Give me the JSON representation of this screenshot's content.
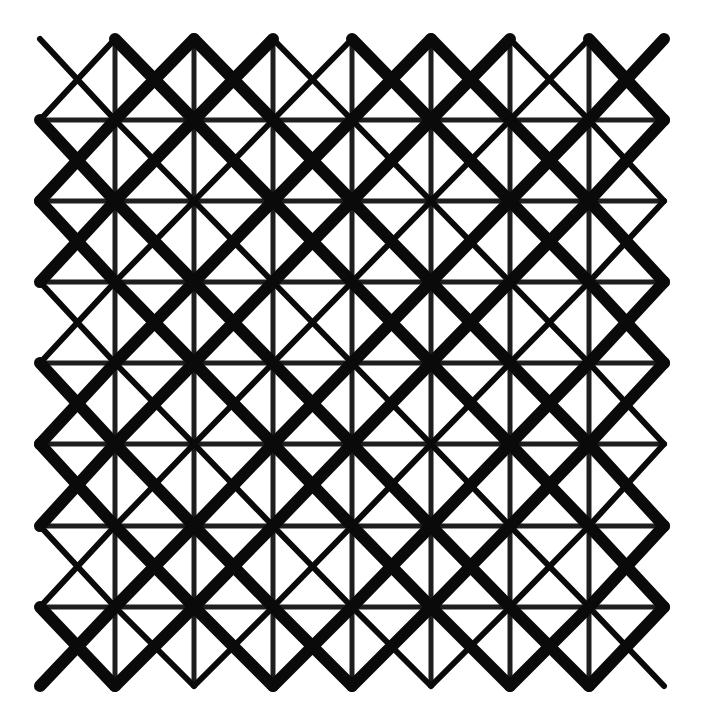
{
  "artwork": {
    "title": "Geometric lattice pattern",
    "background_color": "#ffffff",
    "ink_color": "#0a0a0a",
    "grid_color": "#1e1e1e",
    "bounds": {
      "left": 40,
      "top": 39,
      "right": 664,
      "bottom": 686
    },
    "verticals_x": [
      115,
      194,
      273,
      352,
      431,
      510,
      589
    ],
    "horizontals_y": [
      120,
      201,
      282,
      363,
      444,
      526,
      607
    ],
    "grid_stroke_width": 5,
    "thin_diagonal_width": 6,
    "thick_diagonal_width": 12,
    "down_right_weights": [
      1,
      0,
      1,
      1,
      0,
      1,
      1,
      0,
      1,
      1,
      0,
      1,
      1,
      0,
      1,
      1,
      0
    ],
    "up_right_weights": [
      0,
      1,
      1,
      0,
      1,
      1,
      0,
      1,
      1,
      0,
      1,
      1,
      0,
      1,
      1,
      0,
      1
    ]
  }
}
